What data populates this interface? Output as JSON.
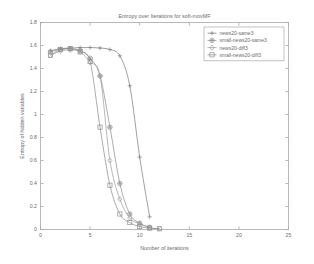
{
  "chart_data": {
    "type": "line",
    "title": "Entropy over Iterations for soft-movMF",
    "xlabel": "Number of iterations",
    "ylabel": "Entropy of hidden variables",
    "xlim": [
      0,
      25
    ],
    "ylim": [
      0,
      1.8
    ],
    "xticks": [
      "0",
      "5",
      "10",
      "15",
      "20",
      "25"
    ],
    "xtick_values": [
      0,
      5,
      10,
      15,
      20,
      25
    ],
    "yticks": [
      "0",
      "0.2",
      "0.4",
      "0.6",
      "0.8",
      "1",
      "1.2",
      "1.4",
      "1.6",
      "1.8"
    ],
    "ytick_values": [
      0,
      0.2,
      0.4,
      0.6,
      0.8,
      1.0,
      1.2,
      1.4,
      1.6,
      1.8
    ],
    "grid": false,
    "legend_position": "top-right",
    "series": [
      {
        "name": "news20-same3",
        "marker": "plus",
        "color": "#808080",
        "x": [
          1,
          2,
          3,
          4,
          5,
          6,
          7,
          8,
          9,
          10,
          11
        ],
        "y": [
          1.555,
          1.572,
          1.578,
          1.582,
          1.582,
          1.578,
          1.565,
          1.51,
          1.25,
          0.63,
          0.11
        ]
      },
      {
        "name": "small-news20-same3",
        "marker": "hexagram",
        "color": "#8f8f8f",
        "x": [
          1,
          2,
          3,
          4,
          5,
          6,
          7,
          8,
          9,
          10,
          11
        ],
        "y": [
          1.545,
          1.565,
          1.572,
          1.556,
          1.49,
          1.335,
          0.89,
          0.4,
          0.135,
          0.055,
          0.02
        ]
      },
      {
        "name": "news20-diff3",
        "marker": "diamond",
        "color": "#a0a0a0",
        "x": [
          1,
          2,
          3,
          4,
          5,
          6,
          7,
          8,
          9,
          10,
          11,
          12
        ],
        "y": [
          1.515,
          1.55,
          1.562,
          1.545,
          1.455,
          1.335,
          0.6,
          0.265,
          0.1,
          0.05,
          0.015,
          0.008
        ]
      },
      {
        "name": "small-news20-diff3",
        "marker": "square",
        "color": "#909090",
        "x": [
          1,
          2,
          3,
          4,
          5,
          6,
          7,
          8,
          9,
          10,
          11,
          12
        ],
        "y": [
          1.515,
          1.565,
          1.572,
          1.545,
          1.46,
          0.89,
          0.385,
          0.135,
          0.06,
          0.025,
          0.012,
          0.006
        ]
      }
    ]
  },
  "colors": {
    "axis": "#a8a8a8",
    "text": "#6b6b6b",
    "background": "#ffffff"
  }
}
